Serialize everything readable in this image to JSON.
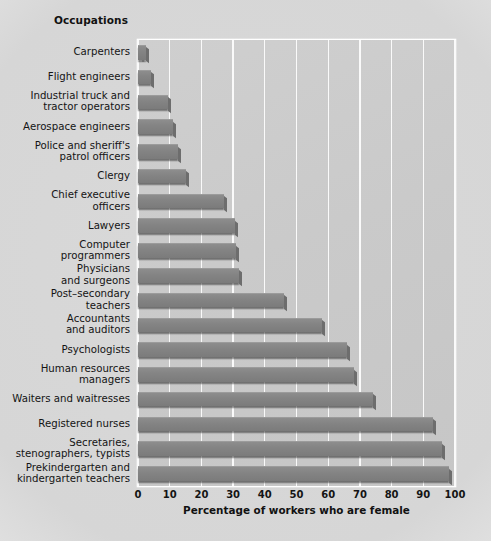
{
  "chart_data": {
    "type": "bar",
    "orientation": "horizontal",
    "title": "",
    "column_header": "Occupations",
    "xlabel": "Percentage of workers who are female",
    "ylabel": "Occupations",
    "xlim": [
      0,
      100
    ],
    "xticks": [
      0,
      10,
      20,
      30,
      40,
      50,
      60,
      70,
      80,
      90,
      100
    ],
    "xtick_labels": [
      "0",
      "10",
      "20",
      "30",
      "40",
      "50",
      "60",
      "70",
      "80",
      "90",
      "100"
    ],
    "grid": "vertical",
    "legend": "none",
    "bar_color": "#848484",
    "plot_background": "#cacaca",
    "figure_background": "#d8d8d8",
    "gridline_color": "#fafafa",
    "categories": [
      "Carpenters",
      "Flight engineers",
      "Industrial truck and tractor operators",
      "Aerospace engineers",
      "Police and sheriff's patrol officers",
      "Clergy",
      "Chief executive officers",
      "Lawyers",
      "Computer programmers",
      "Physicians and surgeons",
      "Post–secondary teachers",
      "Accountants and auditors",
      "Psychologists",
      "Human resources managers",
      "Waiters and waitresses",
      "Registered nurses",
      "Secretaries, stenographers, typists",
      "Prekindergarten and kindergarten teachers"
    ],
    "category_lines": [
      [
        "Carpenters"
      ],
      [
        "Flight engineers"
      ],
      [
        "Industrial truck and",
        "tractor operators"
      ],
      [
        "Aerospace engineers"
      ],
      [
        "Police and sheriff's",
        "patrol officers"
      ],
      [
        "Clergy"
      ],
      [
        "Chief executive",
        "officers"
      ],
      [
        "Lawyers"
      ],
      [
        "Computer",
        "programmers"
      ],
      [
        "Physicians",
        "and surgeons"
      ],
      [
        "Post–secondary",
        "teachers"
      ],
      [
        "Accountants",
        "and auditors"
      ],
      [
        "Psychologists"
      ],
      [
        "Human resources",
        "managers"
      ],
      [
        "Waiters and waitresses"
      ],
      [
        "Registered nurses"
      ],
      [
        "Secretaries,",
        "stenographers, typists"
      ],
      [
        "Prekindergarten and",
        "kindergarten teachers"
      ]
    ],
    "values": [
      2.5,
      4,
      9.5,
      11,
      12.5,
      15,
      27,
      30.5,
      31,
      32,
      46,
      58,
      66,
      68,
      74,
      93,
      96,
      98
    ],
    "units": "percent"
  }
}
